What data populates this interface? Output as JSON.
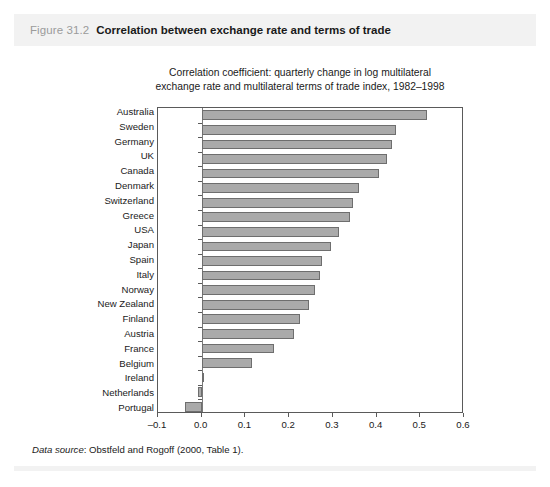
{
  "figure": {
    "number": "Figure 31.2",
    "caption": "Correlation between exchange rate and terms of trade",
    "source_lead": "Data source",
    "source_text": ": Obstfeld and Rogoff (2000, Table 1)."
  },
  "chart_data": {
    "type": "bar",
    "orientation": "horizontal",
    "title": "Correlation coefficient: quarterly change in log multilateral exchange rate and multilateral terms of trade index, 1982–1998",
    "title_lines": [
      "Correlation coefficient: quarterly change in log multilateral",
      "exchange rate and multilateral terms of trade index, 1982–1998"
    ],
    "xlabel": "",
    "ylabel": "",
    "xlim": [
      -0.1,
      0.6
    ],
    "ylim": null,
    "grid": false,
    "legend": null,
    "xticks": [
      -0.1,
      0.0,
      0.1,
      0.2,
      0.3,
      0.4,
      0.5,
      0.6
    ],
    "xticklabels": [
      "–0.1",
      "0.0",
      "0.1",
      "0.2",
      "0.3",
      "0.4",
      "0.5",
      "0.6"
    ],
    "categories": [
      "Australia",
      "Sweden",
      "Germany",
      "UK",
      "Canada",
      "Denmark",
      "Switzerland",
      "Greece",
      "USA",
      "Japan",
      "Spain",
      "Italy",
      "Norway",
      "New Zealand",
      "Finland",
      "Austria",
      "France",
      "Belgium",
      "Ireland",
      "Netherlands",
      "Portugal"
    ],
    "values": [
      0.515,
      0.445,
      0.435,
      0.425,
      0.405,
      0.36,
      0.345,
      0.34,
      0.315,
      0.295,
      0.275,
      0.27,
      0.26,
      0.245,
      0.225,
      0.21,
      0.165,
      0.115,
      0.006,
      -0.008,
      -0.038
    ],
    "bar_color": "#aaaaaa",
    "bar_edge_color": "#6e6e6e"
  },
  "colors": {
    "header_band": "#f2f2f2",
    "text": "#1a1a1a",
    "fig_number": "#9b9b9b",
    "axis": "#5a5a5a"
  }
}
